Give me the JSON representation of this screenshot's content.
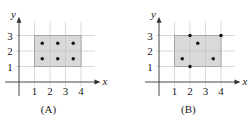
{
  "panels": [
    {
      "id": "A",
      "caption": "(A)",
      "origin_px": [
        19,
        82
      ],
      "unit_px": 15.5,
      "x_label": "x",
      "y_label": "y",
      "x_ticks": [
        "1",
        "2",
        "3",
        "4"
      ],
      "y_ticks": [
        "1",
        "2",
        "3"
      ],
      "rectangle": {
        "x0": 1,
        "x1": 4,
        "y0": 1,
        "y1": 3
      },
      "points": [
        [
          1.5,
          1.5
        ],
        [
          2.5,
          1.5
        ],
        [
          3.5,
          1.5
        ],
        [
          1.5,
          2.5
        ],
        [
          2.5,
          2.5
        ],
        [
          3.5,
          2.5
        ]
      ]
    },
    {
      "id": "B",
      "caption": "(B)",
      "origin_px": [
        159,
        82
      ],
      "unit_px": 15.5,
      "x_label": "x",
      "y_label": "y",
      "x_ticks": [
        "1",
        "2",
        "3",
        "4"
      ],
      "y_ticks": [
        "1",
        "2",
        "3"
      ],
      "rectangle": {
        "x0": 1,
        "x1": 4,
        "y0": 1,
        "y1": 3
      },
      "points": [
        [
          1.5,
          1.5
        ],
        [
          2,
          1
        ],
        [
          2,
          3
        ],
        [
          2.5,
          2.5
        ],
        [
          3.5,
          1.5
        ],
        [
          4,
          3
        ]
      ]
    }
  ],
  "colors": {
    "fill": "#d9d9d9",
    "grid": "#c8c8c8",
    "axis": "#333333",
    "rect_border": "#9a9a9a",
    "point": "#111111"
  }
}
